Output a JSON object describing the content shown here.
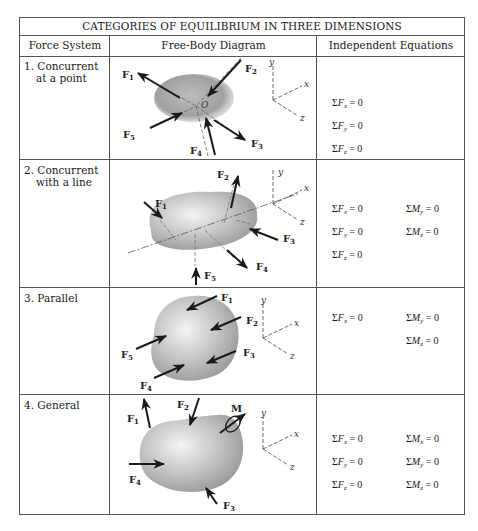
{
  "table": {
    "title": "CATEGORIES OF EQUILIBRIUM IN THREE DIMENSIONS",
    "columns": [
      "Force System",
      "Free-Body Diagram",
      "Independent Equations"
    ],
    "rows": [
      {
        "label_line1": "1. Concurrent",
        "label_line2": "at a point",
        "point_label": "O",
        "forces": [
          "F1",
          "F2",
          "F3",
          "F4",
          "F5"
        ],
        "axes": [
          "x",
          "y",
          "z"
        ],
        "equations_col1": [
          "ΣFx = 0",
          "ΣFy = 0",
          "ΣFz = 0"
        ],
        "equations_col2": []
      },
      {
        "label_line1": "2. Concurrent",
        "label_line2": "with a line",
        "forces": [
          "F1",
          "F2",
          "F3",
          "F4",
          "F5"
        ],
        "axes": [
          "x",
          "y",
          "z"
        ],
        "equations_col1": [
          "ΣFx = 0",
          "ΣFy = 0",
          "ΣFz = 0"
        ],
        "equations_col2": [
          "ΣMy = 0",
          "ΣMz = 0"
        ]
      },
      {
        "label_line1": "3. Parallel",
        "label_line2": "",
        "forces": [
          "F1",
          "F2",
          "F3",
          "F4",
          "F5"
        ],
        "axes": [
          "x",
          "y",
          "z"
        ],
        "equations_col1": [
          "ΣFx = 0"
        ],
        "equations_col2": [
          "ΣMy = 0",
          "ΣMz = 0"
        ]
      },
      {
        "label_line1": "4. General",
        "label_line2": "",
        "moment_label": "M",
        "forces": [
          "F1",
          "F2",
          "F3",
          "F4"
        ],
        "axes": [
          "x",
          "y",
          "z"
        ],
        "equations_col1": [
          "ΣFx = 0",
          "ΣFy = 0",
          "ΣFz = 0"
        ],
        "equations_col2": [
          "ΣMx = 0",
          "ΣMy = 0",
          "ΣMz = 0"
        ]
      }
    ]
  }
}
